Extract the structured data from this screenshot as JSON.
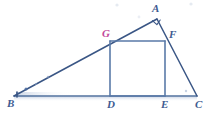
{
  "figure": {
    "type": "geometry-diagram",
    "background_color": "#ffffff",
    "stroke_color": "#51719f",
    "stroke_color_dark": "#3a5685",
    "label_color": "#3e5b91",
    "accent_label_color": "#c2479a",
    "labels": [
      {
        "id": "A",
        "text": "A",
        "x": 152,
        "y": 4,
        "accent": false
      },
      {
        "id": "G",
        "text": "G",
        "x": 102,
        "y": 28,
        "accent": true
      },
      {
        "id": "F",
        "text": "F",
        "x": 168,
        "y": 29,
        "accent": false
      },
      {
        "id": "B",
        "text": "B",
        "x": 7,
        "y": 97,
        "accent": false
      },
      {
        "id": "D",
        "text": "D",
        "x": 107,
        "y": 98,
        "accent": false
      },
      {
        "id": "E",
        "text": "E",
        "x": 161,
        "y": 98,
        "accent": false
      },
      {
        "id": "C",
        "text": "C",
        "x": 195,
        "y": 98,
        "accent": false
      }
    ],
    "points": {
      "A": {
        "x": 157,
        "y": 19
      },
      "B": {
        "x": 14,
        "y": 96
      },
      "C": {
        "x": 197,
        "y": 96
      },
      "D": {
        "x": 110,
        "y": 96
      },
      "E": {
        "x": 165,
        "y": 96
      },
      "F": {
        "x": 165,
        "y": 41
      },
      "G": {
        "x": 110,
        "y": 41
      }
    },
    "segments": [
      {
        "name": "BC-base",
        "from": "B",
        "to": "C"
      },
      {
        "name": "BA-hypotenuse",
        "from": "B",
        "to": "A"
      },
      {
        "name": "AC-side",
        "from": "A",
        "to": "C"
      },
      {
        "name": "GF-square-top",
        "from": "G",
        "to": "F"
      },
      {
        "name": "GD-square-left",
        "from": "G",
        "to": "D"
      },
      {
        "name": "FE-square-right",
        "from": "F",
        "to": "E"
      },
      {
        "name": "DE-square-bottom",
        "from": "D",
        "to": "E"
      }
    ],
    "right_angle_marker": {
      "at": "A",
      "size": 6
    }
  }
}
